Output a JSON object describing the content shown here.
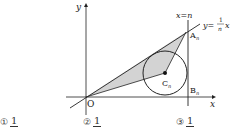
{
  "diagram": {
    "axis_labels": {
      "x": "x",
      "y": "y",
      "origin": "O"
    },
    "lines": {
      "vertical_line": "x=n",
      "slant_line_prefix": "y=",
      "slant_line_num": "1",
      "slant_line_den": "n",
      "slant_line_suffix": "x"
    },
    "points": {
      "A": "A",
      "A_sub": "n",
      "B": "B",
      "B_sub": "n",
      "C": "C",
      "C_sub": "n"
    },
    "colors": {
      "shade": "#d3d3d3",
      "stroke": "#222222"
    }
  },
  "choices": [
    {
      "num": "①",
      "numerator": "1",
      "denominator": ""
    },
    {
      "num": "②",
      "numerator": "1",
      "denominator": ""
    },
    {
      "num": "③",
      "numerator": "1",
      "denominator": ""
    }
  ]
}
